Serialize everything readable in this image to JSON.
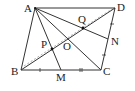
{
  "figure": {
    "type": "parallelogram-geometry",
    "points": {
      "A": {
        "label": "A",
        "x": 35,
        "y": 8
      },
      "B": {
        "label": "B",
        "x": 21,
        "y": 70
      },
      "C": {
        "label": "C",
        "x": 101,
        "y": 70
      },
      "D": {
        "label": "D",
        "x": 115,
        "y": 8
      },
      "O": {
        "label": "O",
        "x": 68,
        "y": 39
      },
      "M": {
        "label": "M",
        "x": 61,
        "y": 70
      },
      "N": {
        "label": "N",
        "x": 108,
        "y": 39
      },
      "P": {
        "label": "P",
        "x": 52,
        "y": 49
      },
      "Q": {
        "label": "Q",
        "x": 83,
        "y": 28
      }
    },
    "segments": [
      "AB",
      "BC",
      "CD",
      "DA",
      "AC",
      "BD",
      "AM",
      "AN"
    ],
    "dashed_segments": [
      "BD-offset"
    ],
    "tick_marks": {
      "BM": 1,
      "MC": 2,
      "DN": 1,
      "NC": 1
    },
    "stroke_color": "#333333",
    "dashed_color": "#9a9a9a"
  }
}
